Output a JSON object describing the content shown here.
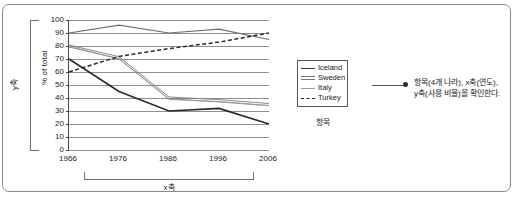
{
  "annotation": {
    "line1": "항목(4개 나라), x축(연도),",
    "line2": "y축(사용 비율)을 확인한다."
  },
  "brackets": {
    "y_label": "y축",
    "x_label": "x축"
  },
  "legend_caption": "항목",
  "chart_data": {
    "type": "line",
    "title": "",
    "xlabel": "",
    "ylabel": "% of total",
    "x": [
      1966,
      1976,
      1986,
      1996,
      2006
    ],
    "categories": [
      "1966",
      "1976",
      "1986",
      "1996",
      "2006"
    ],
    "ylim": [
      0,
      100
    ],
    "yticks": [
      0,
      10,
      20,
      30,
      40,
      50,
      60,
      70,
      80,
      90,
      100
    ],
    "grid": true,
    "legend_position": "right",
    "series": [
      {
        "name": "Iceland",
        "style": "solid-gray",
        "color": "#6f6f6f",
        "values": [
          90,
          96,
          90,
          93,
          85
        ]
      },
      {
        "name": "Sweden",
        "style": "double-gray",
        "color": "#7d7d7d",
        "values": [
          80,
          71,
          40,
          38,
          35
        ]
      },
      {
        "name": "Italy",
        "style": "thin-gray",
        "color": "#9a9a9a",
        "values": [
          80,
          70,
          39,
          37,
          34
        ]
      },
      {
        "name": "Turkey",
        "style": "dashed",
        "color": "#2a2a2a",
        "values": [
          60,
          72,
          78,
          83,
          90
        ]
      },
      {
        "name": "Iceland-solid-black",
        "style": "solid-black",
        "color": "#2a2a2a",
        "values": [
          70,
          45,
          30,
          32,
          20
        ]
      }
    ]
  }
}
